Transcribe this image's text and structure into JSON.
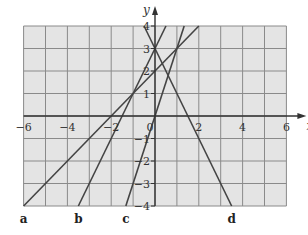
{
  "chart_data": {
    "type": "line",
    "title": "",
    "xlabel": "x",
    "ylabel": "y",
    "xlim": [
      -6,
      6
    ],
    "ylim": [
      -4,
      4
    ],
    "grid": true,
    "grid_step": 1,
    "x_tick_labels": [
      {
        "value": -6,
        "label": "−6"
      },
      {
        "value": -4,
        "label": "−4"
      },
      {
        "value": -2,
        "label": "−2"
      },
      {
        "value": 0,
        "label": "0"
      },
      {
        "value": 2,
        "label": "2"
      },
      {
        "value": 4,
        "label": "4"
      },
      {
        "value": 6,
        "label": "6"
      }
    ],
    "y_tick_labels": [
      {
        "value": 4,
        "label": "4"
      },
      {
        "value": 3,
        "label": "3"
      },
      {
        "value": 2,
        "label": "2"
      },
      {
        "value": 1,
        "label": "1"
      },
      {
        "value": -1,
        "label": "−1"
      },
      {
        "value": -2,
        "label": "−2"
      },
      {
        "value": -3,
        "label": "−3"
      },
      {
        "value": -4,
        "label": "−4"
      }
    ],
    "series": [
      {
        "name": "a",
        "equation": "y = x + 2",
        "points": [
          [
            -6,
            -4
          ],
          [
            2,
            4
          ]
        ],
        "label_x": -6
      },
      {
        "name": "b",
        "equation": "y = 2x + 3",
        "points": [
          [
            -3.5,
            -4
          ],
          [
            0.5,
            4
          ]
        ],
        "label_x": -3.5
      },
      {
        "name": "c",
        "equation": "y = 3x",
        "points": [
          [
            -1.333,
            -4
          ],
          [
            1.333,
            4
          ]
        ],
        "label_x": -1.333
      },
      {
        "name": "d",
        "equation": "y = -2x + 3",
        "points": [
          [
            -0.5,
            4
          ],
          [
            3.5,
            -4
          ]
        ],
        "label_x": 3.5
      }
    ]
  },
  "colors": {
    "grid_fill": "#e4e4e4",
    "grid_line": "#8a8a8a",
    "axis": "#333333",
    "series_line": "#444444"
  }
}
